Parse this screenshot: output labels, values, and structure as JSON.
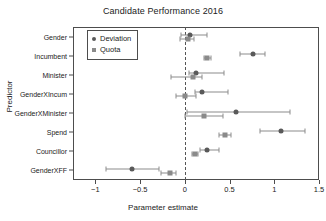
{
  "chart_data": {
    "type": "scatter",
    "title": "Candidate Performance 2016",
    "xlabel": "Parameter estimate",
    "ylabel": "Predictor",
    "xlim": [
      -1.25,
      1.5
    ],
    "ylim": [
      0,
      8
    ],
    "grid": false,
    "legend_position": "top-left-inside",
    "reference_line": {
      "x": 0,
      "style": "dashed"
    },
    "xticks": [
      -1,
      -0.5,
      0,
      0.5,
      1,
      1.5
    ],
    "xticklabels": [
      "−1",
      "−0.5",
      "0",
      "0.5",
      "1",
      "1.5"
    ],
    "categories": [
      "Gender",
      "Incumbent",
      "Minister",
      "GenderXIncum",
      "GenderXMinister",
      "Spend",
      "Councillor",
      "GenderXFF"
    ],
    "series": [
      {
        "name": "Deviation",
        "marker": "circle",
        "color": "#595959",
        "values": [
          0.06,
          0.76,
          0.12,
          0.19,
          0.57,
          1.08,
          0.25,
          -0.59
        ],
        "ci_low": [
          -0.04,
          0.62,
          0.05,
          0.11,
          0.02,
          0.84,
          0.17,
          -0.88
        ],
        "ci_high": [
          0.25,
          0.9,
          0.44,
          0.48,
          1.18,
          1.34,
          0.38,
          -0.29
        ]
      },
      {
        "name": "Quota",
        "marker": "square",
        "color": "#8a8a8a",
        "values": [
          0.03,
          0.25,
          0.09,
          0.0,
          0.21,
          0.45,
          0.11,
          -0.17
        ],
        "ci_low": [
          -0.05,
          0.21,
          -0.15,
          -0.1,
          0.0,
          0.38,
          0.08,
          -0.27
        ],
        "ci_high": [
          0.1,
          0.29,
          0.19,
          0.13,
          0.43,
          0.52,
          0.15,
          -0.1
        ]
      }
    ]
  },
  "legend": {
    "items": [
      {
        "label": "Deviation",
        "marker": "circle"
      },
      {
        "label": "Quota",
        "marker": "square"
      }
    ]
  }
}
